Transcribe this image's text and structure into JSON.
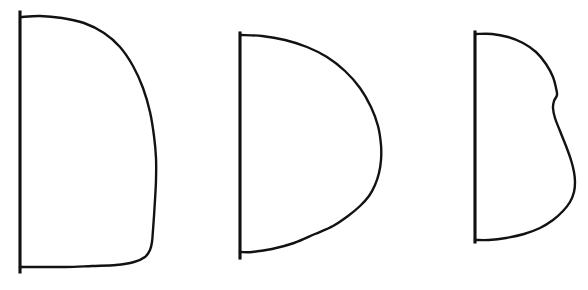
{
  "figure": {
    "background_color": "#ffffff",
    "ink_color": "#121212",
    "width": 588,
    "height": 290,
    "panel_count": 3
  },
  "chart_data": {
    "type": "line",
    "xlabel": "",
    "ylabel": "",
    "grid": false,
    "legend_position": "none",
    "xlim": [
      0,
      588
    ],
    "ylim": [
      290,
      0
    ],
    "note": "Coordinates are pixel positions in the original 588x290 image; y increases downward.",
    "series": [
      {
        "name": "panel-1-axis",
        "panel": 1,
        "kind": "vertical-axis",
        "x": [
          20,
          20
        ],
        "y": [
          12,
          272
        ]
      },
      {
        "name": "panel-1-profile",
        "panel": 1,
        "kind": "outline",
        "comment": "Flat wide top, steep right shoulder, long near-vertical right flank, rounded bottom-right corner into baseline",
        "x": [
          21,
          40,
          62,
          84,
          104,
          120,
          133,
          143,
          150,
          154,
          156,
          156,
          155,
          154,
          153,
          152,
          150,
          145,
          134,
          116,
          92,
          66,
          42,
          22
        ],
        "y": [
          17,
          16,
          18,
          23,
          33,
          47,
          66,
          88,
          112,
          136,
          158,
          180,
          200,
          216,
          230,
          242,
          250,
          257,
          262,
          265,
          266,
          267,
          267,
          267
        ]
      },
      {
        "name": "panel-2-axis",
        "panel": 2,
        "kind": "vertical-axis",
        "x": [
          240,
          240
        ],
        "y": [
          33,
          258
        ]
      },
      {
        "name": "panel-2-profile",
        "panel": 2,
        "kind": "outline",
        "comment": "Rounder, more symmetric D with bulge at mid-height near x=381",
        "x": [
          241,
          262,
          285,
          307,
          327,
          345,
          360,
          371,
          378,
          381,
          381,
          379,
          375,
          369,
          360,
          348,
          333,
          315,
          294,
          272,
          252,
          241
        ],
        "y": [
          35,
          36,
          40,
          47,
          57,
          71,
          88,
          107,
          126,
          145,
          160,
          173,
          185,
          196,
          206,
          216,
          226,
          234,
          243,
          249,
          252,
          252
        ]
      },
      {
        "name": "panel-3-axis",
        "panel": 3,
        "kind": "vertical-axis",
        "x": [
          475,
          475
        ],
        "y": [
          32,
          242
        ]
      },
      {
        "name": "panel-3-profile",
        "panel": 3,
        "kind": "outline",
        "comment": "Upper lobe curves out then pinches inward at a concave notch near y=98, then swells again to maximum width near y=170",
        "x": [
          476,
          492,
          508,
          523,
          536,
          546,
          553,
          556,
          557,
          554,
          553,
          555,
          560,
          566,
          571,
          574,
          575,
          574,
          570,
          563,
          553,
          540,
          524,
          506,
          489,
          476
        ],
        "y": [
          34,
          34,
          37,
          43,
          52,
          64,
          77,
          88,
          95,
          101,
          108,
          118,
          131,
          146,
          160,
          172,
          182,
          192,
          202,
          211,
          220,
          228,
          234,
          238,
          240,
          240
        ]
      }
    ],
    "annotations": [
      {
        "panel": 1,
        "label": "squarish profile",
        "max_width_px": 136,
        "height_px": 255
      },
      {
        "panel": 2,
        "label": "rounded profile",
        "max_width_px": 141,
        "height_px": 219
      },
      {
        "panel": 3,
        "label": "notched profile",
        "max_width_px": 100,
        "height_px": 208
      }
    ]
  }
}
